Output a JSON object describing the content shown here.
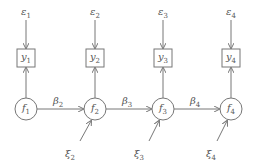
{
  "diagram": {
    "type": "path-diagram",
    "columns": [
      {
        "error": {
          "sym": "ε",
          "sub": "1"
        },
        "obs": {
          "sym": "y",
          "sub": "1"
        },
        "factor": {
          "sym": "f",
          "sub": "1"
        }
      },
      {
        "error": {
          "sym": "ε",
          "sub": "2"
        },
        "obs": {
          "sym": "y",
          "sub": "2"
        },
        "factor": {
          "sym": "f",
          "sub": "2"
        },
        "path": {
          "sym": "β",
          "sub": "2"
        },
        "disturbance": {
          "sym": "ξ",
          "sub": "2"
        }
      },
      {
        "error": {
          "sym": "ε",
          "sub": "3"
        },
        "obs": {
          "sym": "y",
          "sub": "3"
        },
        "factor": {
          "sym": "f",
          "sub": "3"
        },
        "path": {
          "sym": "β",
          "sub": "3"
        },
        "disturbance": {
          "sym": "ξ",
          "sub": "3"
        }
      },
      {
        "error": {
          "sym": "ε",
          "sub": "4"
        },
        "obs": {
          "sym": "y",
          "sub": "4"
        },
        "factor": {
          "sym": "f",
          "sub": "4"
        },
        "path": {
          "sym": "β",
          "sub": "4"
        },
        "disturbance": {
          "sym": "ξ",
          "sub": "4"
        }
      }
    ],
    "line_color": "#777777"
  }
}
